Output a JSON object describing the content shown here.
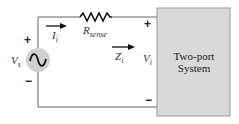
{
  "diagram": {
    "source": {
      "label": "V",
      "sub": "s",
      "plus": "+",
      "minus": "−"
    },
    "current": {
      "label": "I",
      "sub": "i"
    },
    "resistor": {
      "label": "R",
      "sub": "sense"
    },
    "impedance": {
      "label": "Z",
      "sub": "i"
    },
    "voltage": {
      "label": "V",
      "sub": "i",
      "plus": "+",
      "minus": "−"
    },
    "system": {
      "line1": "Two-port",
      "line2": "System"
    },
    "colors": {
      "wire": "#666666",
      "box_fill": "#d9d9d9",
      "box_stroke": "#999999",
      "source_fill": "#d0d0d0"
    }
  }
}
